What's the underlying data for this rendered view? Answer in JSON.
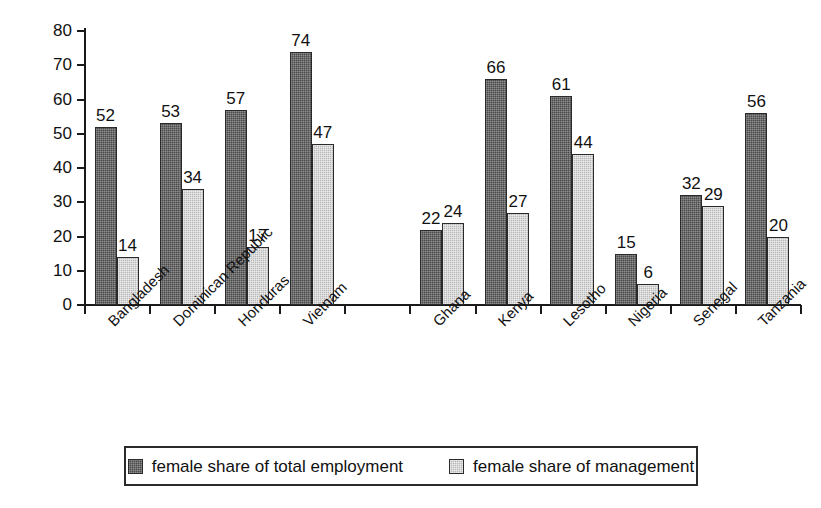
{
  "chart_data": {
    "type": "bar",
    "title": "",
    "subtitle": "",
    "xlabel": "",
    "ylabel": "percent",
    "ylim": [
      0,
      80
    ],
    "yticks": [
      0,
      10,
      20,
      30,
      40,
      50,
      60,
      70,
      80
    ],
    "grid": false,
    "legend_position": "bottom",
    "categories": [
      "Bangladesh",
      "Dominican Republic",
      "Honduras",
      "Vietnam",
      "Ghana",
      "Kenya",
      "Lesotho",
      "Nigeria",
      "Senegal",
      "Tanzania"
    ],
    "group_gap_after_index": 3,
    "series": [
      {
        "name": "female share of total employment",
        "color": "#4a4a4a",
        "values": [
          52,
          53,
          57,
          74,
          22,
          66,
          61,
          15,
          32,
          56
        ]
      },
      {
        "name": "female share of management",
        "color": "#b9b9b9",
        "values": [
          14,
          34,
          17,
          47,
          24,
          27,
          44,
          6,
          29,
          20
        ]
      }
    ]
  },
  "legend": {
    "entries": [
      {
        "label": "female share of total employment"
      },
      {
        "label": "female share of management"
      }
    ]
  },
  "colors": {
    "series_dark": "#4a4a4a",
    "series_light": "#b9b9b9",
    "axis": "#1a1a1a",
    "text": "#111111",
    "background": "#ffffff"
  }
}
